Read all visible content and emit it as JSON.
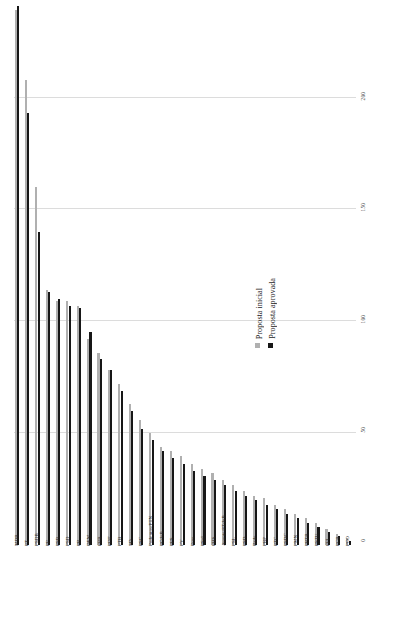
{
  "legend": {
    "position": "inside-right",
    "entries": [
      {
        "label": "Proposta inicial",
        "color": "#b0b0b0"
      },
      {
        "label": "Proposta aprovada",
        "color": "#171717"
      }
    ]
  },
  "axis": {
    "ticks": [
      "200",
      "150",
      "100",
      "50",
      "0"
    ],
    "tick_values": [
      200,
      150,
      100,
      50,
      0
    ]
  },
  "chart_data": {
    "type": "bar",
    "title": "",
    "subtitle": "",
    "xlabel": "",
    "ylabel": "",
    "ylim": [
      0,
      240
    ],
    "grid": true,
    "orientation": "vertical-bars-rotated-labels",
    "legend_position": "inside-right",
    "categories": [
      "MDB",
      "PT",
      "PSDB",
      "PP",
      "PSB",
      "PSD",
      "PR",
      "DEM",
      "PRB",
      "PDT",
      "PTB",
      "SD",
      "PSC",
      "Podemos/PTN",
      "PCdoB",
      "PPS",
      "PV",
      "Pros",
      "PSol",
      "PHS",
      "Avante/PTdoB",
      "PSL",
      "PSD",
      "Rede",
      "PRP",
      "PTC",
      "PSDC",
      "PMN",
      "PRTB",
      "PSTU",
      "PPL",
      "PCB",
      "PCO"
    ],
    "series": [
      {
        "name": "Proposta inicial",
        "color": "#b0b0b0",
        "values": [
          239,
          208,
          160,
          114,
          109,
          109,
          107,
          92,
          86,
          78,
          72,
          63,
          56,
          50,
          44,
          42,
          40,
          36,
          34,
          32,
          29,
          27,
          24,
          22,
          21,
          18,
          16,
          14,
          12,
          10,
          7,
          5,
          3
        ]
      },
      {
        "name": "Proposta aprovada",
        "color": "#171717",
        "values": [
          241,
          193,
          140,
          113,
          110,
          107,
          106,
          95,
          83,
          78,
          69,
          60,
          52,
          47,
          42,
          39,
          36,
          33,
          31,
          29,
          27,
          24,
          22,
          20,
          18,
          16,
          14,
          12,
          10,
          8,
          6,
          4,
          2
        ]
      }
    ]
  }
}
